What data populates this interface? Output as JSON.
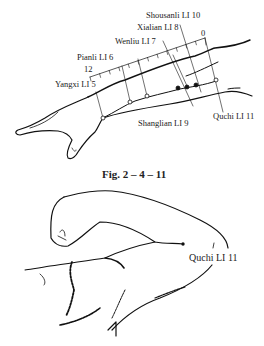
{
  "figure_top": {
    "labels": {
      "shousanli": "Shousanli LI  10",
      "xialian": "Xialian LI  8",
      "wenliu": "Wenliu LI  7",
      "pianli": "Pianli LI  6",
      "yangxi": "Yangxi LI  5",
      "shanglian": "Shanglian LI  9",
      "quchi": "Quchi LI 11"
    },
    "scale": {
      "start": "12",
      "end": "0"
    },
    "caption": "Fig. 2 – 4 – 11"
  },
  "figure_bottom": {
    "labels": {
      "quchi": "Quchi LI  11"
    }
  }
}
